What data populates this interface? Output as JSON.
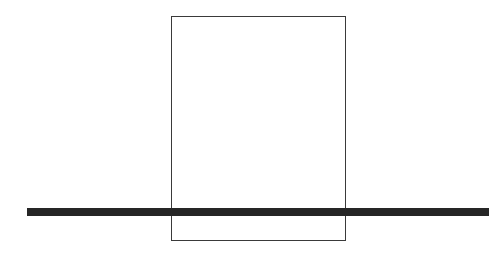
{
  "diagram": {
    "background": "#ffffff",
    "rectangle": {
      "x": 171,
      "y": 16,
      "width": 175,
      "height": 225,
      "stroke": "#3a3a3a",
      "fill": "none"
    },
    "bar": {
      "x": 27,
      "y": 208,
      "width": 462,
      "height": 8,
      "fill": "#262626"
    }
  }
}
